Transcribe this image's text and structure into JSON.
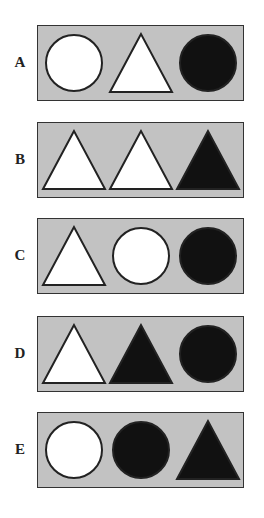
{
  "question": {
    "options": [
      {
        "label": "A",
        "shapes": [
          {
            "type": "circle",
            "fill": "white"
          },
          {
            "type": "triangle",
            "fill": "white"
          },
          {
            "type": "circle",
            "fill": "black"
          }
        ]
      },
      {
        "label": "B",
        "shapes": [
          {
            "type": "triangle",
            "fill": "white"
          },
          {
            "type": "triangle",
            "fill": "white"
          },
          {
            "type": "triangle",
            "fill": "black"
          }
        ]
      },
      {
        "label": "C",
        "shapes": [
          {
            "type": "triangle",
            "fill": "white"
          },
          {
            "type": "circle",
            "fill": "white"
          },
          {
            "type": "circle",
            "fill": "black"
          }
        ]
      },
      {
        "label": "D",
        "shapes": [
          {
            "type": "triangle",
            "fill": "white"
          },
          {
            "type": "triangle",
            "fill": "black"
          },
          {
            "type": "circle",
            "fill": "black"
          }
        ]
      },
      {
        "label": "E",
        "shapes": [
          {
            "type": "circle",
            "fill": "white"
          },
          {
            "type": "circle",
            "fill": "black"
          },
          {
            "type": "triangle",
            "fill": "black"
          }
        ]
      }
    ]
  },
  "colors": {
    "panel_bg": "#c2c2c2",
    "border": "#333333",
    "white": "#ffffff",
    "black": "#111111"
  }
}
